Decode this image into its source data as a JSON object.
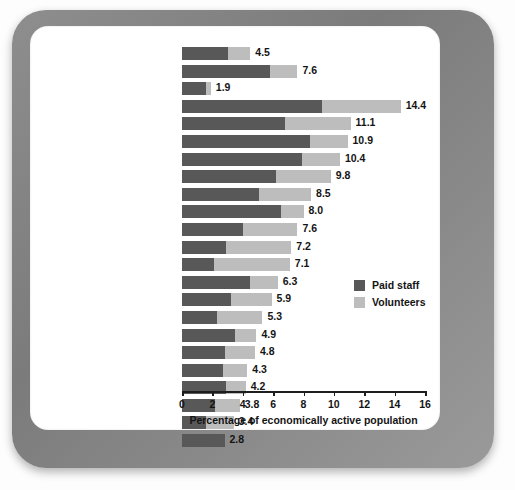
{
  "chart_data": {
    "type": "bar",
    "orientation": "horizontal",
    "stacked": true,
    "title": "",
    "xlabel": "Percentage of economically active population",
    "ylabel": "",
    "xlim": [
      0,
      16
    ],
    "xticks": [
      0,
      2,
      4,
      6,
      8,
      10,
      12,
      14,
      16
    ],
    "grid": false,
    "legend_position": "right-middle",
    "legend": [
      "Paid staff",
      "Volunteers"
    ],
    "colors": {
      "paid_staff": "#585858",
      "volunteers": "#bdbdbd"
    },
    "categories": [
      "37 countries",
      "Developed countries",
      "Developing/Transitional",
      "Netherlands",
      "Canada",
      "Belgium",
      "Ireland",
      "U.S.",
      "U.K.",
      "Israel",
      "France",
      "Norway",
      "Sweden",
      "Australia",
      "Germany",
      "Finland",
      "Austria",
      "Argentina",
      "Spain",
      "Japan",
      "Italy",
      "South Africa",
      "Egypt"
    ],
    "series": [
      {
        "name": "Paid staff",
        "values": [
          3.0,
          5.8,
          1.6,
          9.2,
          6.8,
          8.4,
          7.9,
          6.2,
          5.1,
          6.5,
          4.0,
          2.9,
          2.1,
          4.5,
          3.2,
          2.3,
          3.5,
          2.8,
          2.7,
          2.9,
          2.2,
          1.6,
          2.8
        ]
      },
      {
        "name": "Volunteers",
        "values": [
          1.5,
          1.8,
          0.3,
          5.2,
          4.3,
          2.5,
          2.5,
          3.6,
          3.4,
          1.5,
          3.6,
          4.3,
          5.0,
          1.8,
          2.7,
          3.0,
          1.4,
          2.0,
          1.6,
          1.3,
          1.6,
          1.8,
          0.0
        ]
      }
    ],
    "totals": [
      4.5,
      7.6,
      1.9,
      14.4,
      11.1,
      10.9,
      10.4,
      9.8,
      8.5,
      8.0,
      7.6,
      7.2,
      7.1,
      6.3,
      5.9,
      5.3,
      4.9,
      4.8,
      4.3,
      4.2,
      3.8,
      3.4,
      2.8
    ],
    "total_labels": [
      "4.5",
      "7.6",
      "1.9",
      "14.4",
      "11.1",
      "10.9",
      "10.4",
      "9.8",
      "8.5",
      "8.0",
      "7.6",
      "7.2",
      "7.1",
      "6.3",
      "5.9",
      "5.3",
      "4.9",
      "4.8",
      "4.3",
      "4.2",
      "3.8",
      "3.4",
      "2.8"
    ],
    "xtick_labels": [
      "0",
      "2",
      "4",
      "6",
      "8",
      "10",
      "12",
      "14",
      "16"
    ]
  }
}
